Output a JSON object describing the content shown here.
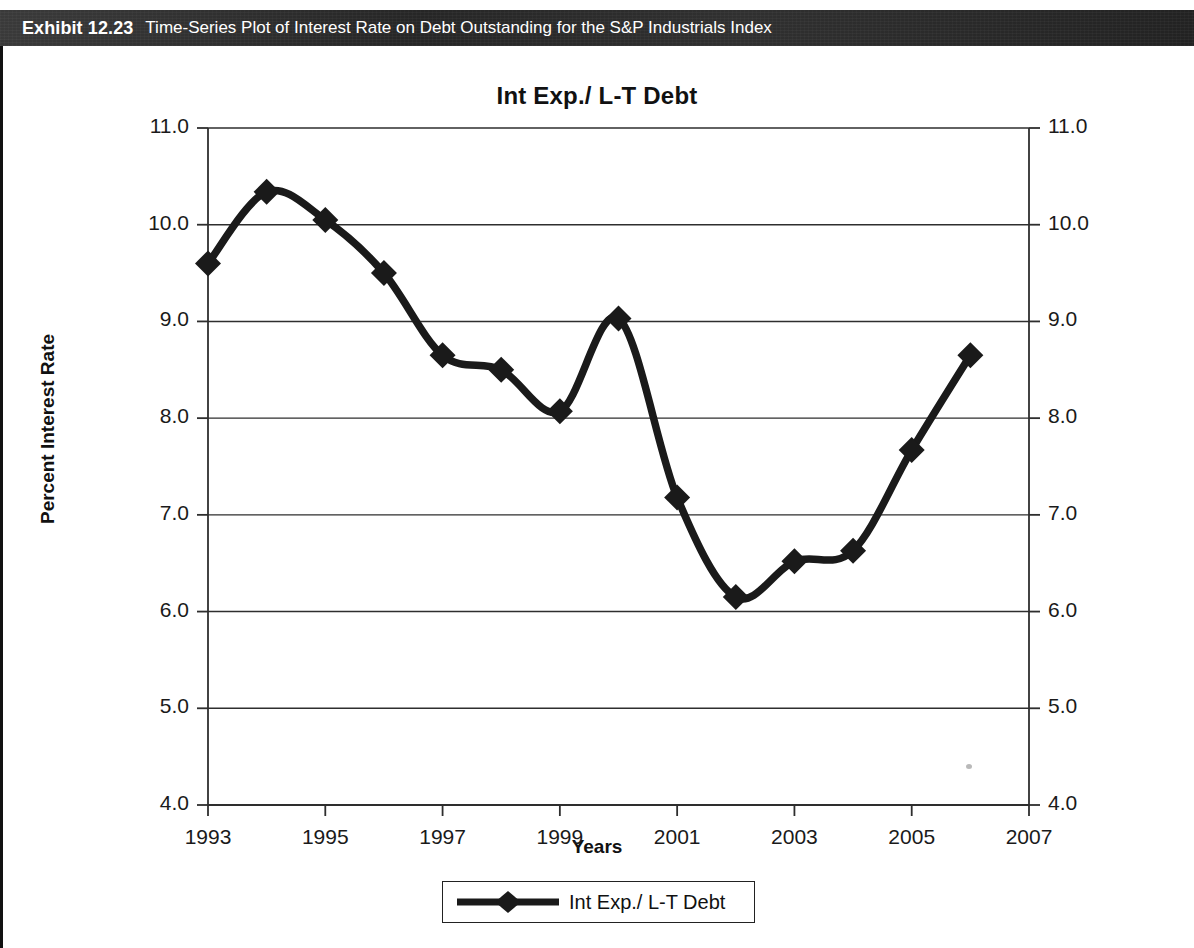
{
  "exhibit": {
    "label": "Exhibit 12.23",
    "title": "Time-Series Plot of Interest Rate on Debt Outstanding for the S&P Industrials Index"
  },
  "chart_data": {
    "type": "line",
    "title": "Int Exp./ L-T Debt",
    "xlabel": "Years",
    "ylabel": "Percent Interest Rate",
    "xlim": [
      1993,
      2007
    ],
    "ylim": [
      4.0,
      11.0
    ],
    "grid": true,
    "dual_y_axis": true,
    "legend_position": "bottom",
    "marker": "diamond",
    "line_color": "#1a1a1a",
    "x_ticks": [
      "1993",
      "1995",
      "1997",
      "1999",
      "2001",
      "2003",
      "2005",
      "2007"
    ],
    "y_ticks": [
      "4.0",
      "5.0",
      "6.0",
      "7.0",
      "8.0",
      "9.0",
      "10.0",
      "11.0"
    ],
    "y_ticks_right": [
      "4.0",
      "5.0",
      "6.0",
      "7.0",
      "8.0",
      "9.0",
      "10.0",
      "11.0"
    ],
    "x": [
      1993,
      1994,
      1995,
      1996,
      1997,
      1998,
      1999,
      2000,
      2001,
      2002,
      2003,
      2004,
      2005,
      2006
    ],
    "series": [
      {
        "name": "Int Exp./ L-T Debt",
        "values": [
          9.6,
          10.34,
          10.05,
          9.5,
          8.65,
          8.5,
          8.07,
          9.03,
          7.18,
          6.15,
          6.52,
          6.63,
          7.67,
          8.65
        ]
      }
    ]
  },
  "legend": {
    "entries": [
      {
        "label": "Int Exp./ L-T Debt",
        "marker": "diamond",
        "color": "#1a1a1a"
      }
    ]
  }
}
